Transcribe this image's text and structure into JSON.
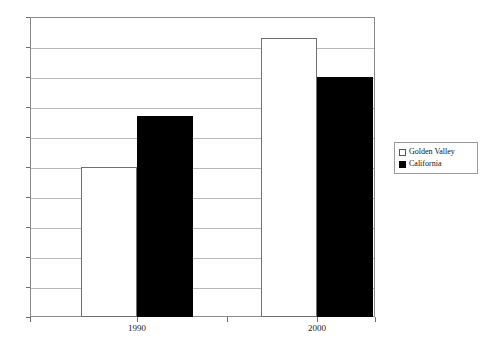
{
  "chart_data": {
    "type": "bar",
    "title": "",
    "subtitle": "",
    "xlabel": "",
    "ylabel": "",
    "categories": [
      "1990",
      "2000"
    ],
    "series": [
      {
        "name": "Golden Valley",
        "color": "#ffffff",
        "border_color": "#707070",
        "values": [
          5.0,
          9.3
        ]
      },
      {
        "name": "California",
        "color": "#000000",
        "border_color": "#000000",
        "values": [
          6.7,
          8.0
        ]
      }
    ],
    "ylim": [
      0,
      10
    ],
    "y_ticks": [
      0,
      1,
      2,
      3,
      4,
      5,
      6,
      7,
      8,
      9,
      10
    ],
    "y_tick_labels": [
      "",
      "",
      "",
      "",
      "",
      "",
      "",
      "",
      "",
      "",
      ""
    ],
    "grid": true,
    "grid_axis": "y",
    "legend_position": "right"
  },
  "legend": {
    "entries": [
      {
        "label": "Golden Valley",
        "swatch": "hollow-square-swatch"
      },
      {
        "label": "California",
        "swatch": "filled-square-swatch"
      }
    ]
  },
  "axes": {
    "x_labels": [
      "1990",
      "2000"
    ]
  },
  "colors": {
    "frame": "#8a8a8a",
    "gridline": "#b9b9b9",
    "bar_golden_valley": "#ffffff",
    "bar_california": "#000000",
    "background": "#ffffff"
  }
}
